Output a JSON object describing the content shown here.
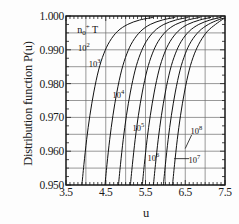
{
  "chart_data": {
    "type": "line",
    "title": "",
    "xlabel": "u",
    "ylabel": "Distribution function P(u)",
    "xlim": [
      3.5,
      7.5
    ],
    "ylim": [
      0.95,
      1.0
    ],
    "grid": true,
    "grid_x_step": 0.5,
    "grid_y_step": 0.005,
    "legend_position": "in-plot-annotations",
    "legend_title": "n0+T",
    "xticks": [
      "3.5",
      "4.5",
      "5.5",
      "6.5",
      "7.5"
    ],
    "xtick_values": [
      3.5,
      4.5,
      5.5,
      6.5,
      7.5
    ],
    "xminor_step": 0.1,
    "yticks": [
      "0.950",
      "0.960",
      "0.970",
      "0.980",
      "0.990",
      "1.000"
    ],
    "ytick_values": [
      0.95,
      0.96,
      0.97,
      0.98,
      0.99,
      1.0
    ],
    "yminor_step": 0.0025,
    "series": [
      {
        "name": "10^2",
        "label_mantissa": "10",
        "label_exponent": "2",
        "label_x": 3.95,
        "label_y": 0.9908,
        "leader": null,
        "x": [
          3.9,
          3.95,
          4.02,
          4.1,
          4.2,
          4.32,
          4.45,
          4.6,
          4.8,
          5.05,
          5.35,
          5.7
        ],
        "y": [
          0.95,
          0.956,
          0.9635,
          0.9705,
          0.9775,
          0.984,
          0.9888,
          0.9925,
          0.9955,
          0.9975,
          0.9988,
          0.9996
        ]
      },
      {
        "name": "10^3",
        "label_mantissa": "10",
        "label_exponent": "3",
        "label_x": 4.22,
        "label_y": 0.986,
        "leader": null,
        "x": [
          4.48,
          4.53,
          4.6,
          4.68,
          4.78,
          4.9,
          5.03,
          5.18,
          5.38,
          5.62,
          5.92,
          6.25
        ],
        "y": [
          0.95,
          0.956,
          0.9635,
          0.9705,
          0.9775,
          0.984,
          0.9888,
          0.9925,
          0.9955,
          0.9975,
          0.9988,
          0.9996
        ]
      },
      {
        "name": "10^4",
        "label_mantissa": "10",
        "label_exponent": "4",
        "label_x": 4.82,
        "label_y": 0.9768,
        "leader": null,
        "x": [
          4.82,
          4.87,
          4.94,
          5.02,
          5.12,
          5.24,
          5.37,
          5.52,
          5.72,
          5.96,
          6.26,
          6.58
        ],
        "y": [
          0.95,
          0.956,
          0.9635,
          0.9705,
          0.9775,
          0.984,
          0.9888,
          0.9925,
          0.9955,
          0.9975,
          0.9988,
          0.9996
        ]
      },
      {
        "name": "unlabeled-5",
        "label_mantissa": "",
        "label_exponent": "",
        "label_x": null,
        "label_y": null,
        "leader": null,
        "x": [
          5.12,
          5.17,
          5.24,
          5.32,
          5.42,
          5.54,
          5.67,
          5.82,
          6.02,
          6.26,
          6.56,
          6.88
        ],
        "y": [
          0.95,
          0.956,
          0.9635,
          0.9705,
          0.9775,
          0.984,
          0.9888,
          0.9925,
          0.9955,
          0.9975,
          0.9988,
          0.9996
        ]
      },
      {
        "name": "10^5",
        "label_mantissa": "10",
        "label_exponent": "5",
        "label_x": 5.32,
        "label_y": 0.9672,
        "leader": null,
        "x": [
          5.42,
          5.47,
          5.54,
          5.62,
          5.72,
          5.84,
          5.97,
          6.12,
          6.32,
          6.56,
          6.86,
          7.15
        ],
        "y": [
          0.95,
          0.956,
          0.9635,
          0.9705,
          0.9775,
          0.984,
          0.9888,
          0.9925,
          0.9955,
          0.9975,
          0.9988,
          0.9996
        ]
      },
      {
        "name": "10^6",
        "label_mantissa": "10",
        "label_exponent": "6",
        "label_x": 5.7,
        "label_y": 0.9582,
        "leader": null,
        "x": [
          5.7,
          5.75,
          5.82,
          5.9,
          6.0,
          6.12,
          6.25,
          6.4,
          6.6,
          6.84,
          7.12,
          7.4
        ],
        "y": [
          0.95,
          0.956,
          0.9635,
          0.9705,
          0.9775,
          0.984,
          0.9888,
          0.9925,
          0.9955,
          0.9975,
          0.9988,
          0.9996
        ]
      },
      {
        "name": "10^7",
        "label_mantissa": "10",
        "label_exponent": "7",
        "label_x": 6.73,
        "label_y": 0.9578,
        "leader": [
          6.6,
          0.9578,
          6.22,
          0.9578
        ],
        "x": [
          5.95,
          6.0,
          6.07,
          6.15,
          6.25,
          6.37,
          6.5,
          6.65,
          6.85,
          7.08,
          7.32,
          7.48
        ],
        "y": [
          0.95,
          0.956,
          0.9635,
          0.9705,
          0.9775,
          0.984,
          0.9888,
          0.9925,
          0.9955,
          0.9975,
          0.9988,
          0.9994
        ]
      },
      {
        "name": "10^8",
        "label_mantissa": "10",
        "label_exponent": "8",
        "label_x": 6.78,
        "label_y": 0.9663,
        "leader": [
          6.66,
          0.9648,
          6.5,
          0.9608
        ],
        "x": [
          6.18,
          6.23,
          6.3,
          6.38,
          6.48,
          6.6,
          6.73,
          6.88,
          7.06,
          7.26,
          7.44,
          7.5
        ],
        "y": [
          0.95,
          0.956,
          0.9635,
          0.9705,
          0.9775,
          0.984,
          0.9888,
          0.9925,
          0.9955,
          0.9975,
          0.999,
          0.9993
        ]
      }
    ],
    "annotations": [
      {
        "text": "n0+T",
        "x": 3.78,
        "y": 0.9962,
        "role": "legend-title"
      }
    ]
  },
  "axis": {
    "y_label": "Distribution function P(u)",
    "x_label": "u",
    "y_ticks": [
      "1.000",
      "0.990",
      "0.980",
      "0.970",
      "0.960",
      "0.950"
    ],
    "x_ticks": [
      "3.5",
      "4.5",
      "5.5",
      "6.5",
      "7.5"
    ]
  },
  "legend": {
    "title_base": "n",
    "title_sub": "0",
    "title_sup": "+",
    "title_tail": "T"
  },
  "colors": {
    "axis": "#1a1a1a",
    "grid": "#6d6d6d",
    "curve": "#111111",
    "background": "#fdfdfd"
  }
}
